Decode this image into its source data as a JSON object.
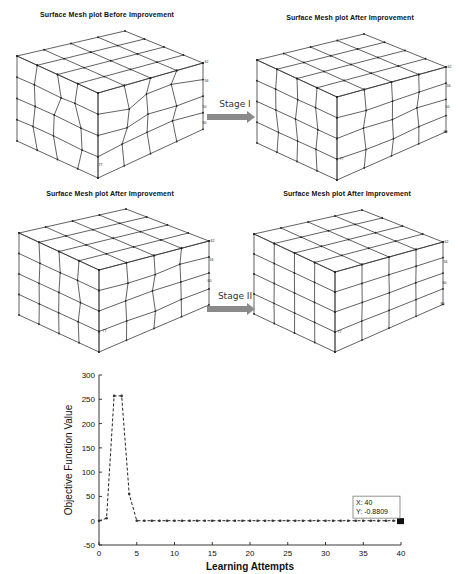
{
  "panels": [
    {
      "id": "mesh-before",
      "title": "Surface Mesh plot Before Improvement",
      "title_x": 107,
      "title_y": 16,
      "box": {
        "A": [
          17,
          56
        ],
        "B": [
          125,
          31
        ],
        "C": [
          203,
          63
        ],
        "D": [
          98,
          93
        ],
        "drop": 85
      },
      "distorted": true,
      "labels": [
        {
          "t": "62",
          "x": 203,
          "y": 62
        },
        {
          "t": "56",
          "x": 203,
          "y": 81
        },
        {
          "t": "50",
          "x": 201,
          "y": 107
        },
        {
          "t": "80",
          "x": 201,
          "y": 123
        },
        {
          "t": "77",
          "x": 97,
          "y": 165
        }
      ]
    },
    {
      "id": "mesh-after-1",
      "title": "Surface Mesh plot After Improvement",
      "title_x": 350,
      "title_y": 19,
      "box": {
        "A": [
          257,
          60
        ],
        "B": [
          364,
          34
        ],
        "C": [
          446,
          67
        ],
        "D": [
          337,
          97
        ],
        "drop": 83
      },
      "distorted": true,
      "labels": [
        {
          "t": "62",
          "x": 446,
          "y": 67
        },
        {
          "t": "56",
          "x": 445,
          "y": 86
        },
        {
          "t": "50",
          "x": 444,
          "y": 107
        },
        {
          "t": "80",
          "x": 442,
          "y": 132
        },
        {
          "t": "77",
          "x": 338,
          "y": 159
        }
      ]
    },
    {
      "id": "mesh-after-2",
      "title": "Surface Mesh plot After Improvement",
      "title_x": 110,
      "title_y": 194,
      "box": {
        "A": [
          19,
          233
        ],
        "B": [
          126,
          209
        ],
        "C": [
          209,
          241
        ],
        "D": [
          99,
          270
        ],
        "drop": 82
      },
      "distorted": true,
      "labels": [
        {
          "t": "62",
          "x": 209,
          "y": 241
        },
        {
          "t": "56",
          "x": 208,
          "y": 260
        },
        {
          "t": "60",
          "x": 206,
          "y": 281
        },
        {
          "t": "77",
          "x": 101,
          "y": 331
        }
      ]
    },
    {
      "id": "mesh-after-3",
      "title": "Surface Mesh plot After Improvement",
      "title_x": 347,
      "title_y": 194,
      "box": {
        "A": [
          254,
          234
        ],
        "B": [
          362,
          210
        ],
        "C": [
          443,
          242
        ],
        "D": [
          335,
          272
        ],
        "drop": 80
      },
      "distorted": false,
      "labels": [
        {
          "t": "62",
          "x": 443,
          "y": 242
        },
        {
          "t": "56",
          "x": 442,
          "y": 262
        },
        {
          "t": "60",
          "x": 441,
          "y": 283
        },
        {
          "t": "80",
          "x": 439,
          "y": 304
        },
        {
          "t": "77",
          "x": 336,
          "y": 332
        }
      ]
    }
  ],
  "stages": [
    {
      "label": "Stage I",
      "x": 235,
      "y": 97,
      "arrow_x1": 207,
      "arrow_x2": 255,
      "arrow_y": 117
    },
    {
      "label": "Stage II",
      "x": 235,
      "y": 288,
      "arrow_x1": 207,
      "arrow_x2": 255,
      "arrow_y": 309
    }
  ],
  "chart_data": {
    "type": "line",
    "title": "",
    "xlabel": "Learning Attempts",
    "ylabel": "Objective Function Value",
    "xlim": [
      0,
      40
    ],
    "ylim": [
      -50,
      300
    ],
    "xticks": [
      0,
      5,
      10,
      15,
      20,
      25,
      30,
      35,
      40
    ],
    "yticks": [
      -50,
      0,
      50,
      100,
      150,
      200,
      250,
      300
    ],
    "grid": false,
    "line_style": "dashed",
    "marker": "dot",
    "x": [
      0,
      1,
      2,
      3,
      4,
      5,
      6,
      7,
      8,
      9,
      10,
      11,
      12,
      13,
      14,
      15,
      16,
      17,
      18,
      19,
      20,
      21,
      22,
      23,
      24,
      25,
      26,
      27,
      28,
      29,
      30,
      31,
      32,
      33,
      34,
      35,
      36,
      37,
      38,
      39,
      40
    ],
    "y": [
      0,
      5,
      257,
      257,
      55,
      0,
      0,
      0,
      0,
      0,
      0,
      0,
      0,
      0,
      0,
      0,
      0,
      0,
      0,
      0,
      0,
      0,
      0,
      0,
      0,
      0,
      0,
      0,
      0,
      0,
      0,
      0,
      0,
      0,
      0,
      0,
      0,
      0,
      0,
      0,
      -0.8809
    ],
    "annotation": {
      "x_label": "X: 40",
      "y_label": "Y: -0.8809",
      "x": 40,
      "y": -0.8809
    }
  }
}
